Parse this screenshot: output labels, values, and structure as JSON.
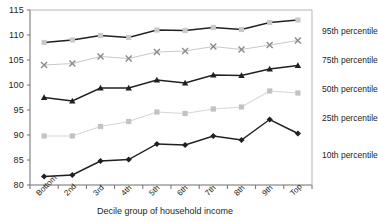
{
  "chart_data": {
    "type": "line",
    "title": "",
    "xlabel": "Decile group of household income",
    "ylabel": "",
    "categories": [
      "Bottom",
      "2nd",
      "3rd",
      "4th",
      "5th",
      "6th",
      "7th",
      "8th",
      "9th",
      "Top"
    ],
    "ylim": [
      80,
      115
    ],
    "yticks": [
      80,
      85,
      90,
      95,
      100,
      105,
      110,
      115
    ],
    "grid": false,
    "legend_position": "right",
    "series": [
      {
        "name": "95th percentile",
        "marker": "square",
        "line_color": "#231f20",
        "marker_color": "#c9c9c9",
        "values": [
          108.5,
          109.0,
          109.9,
          109.5,
          111.0,
          110.9,
          111.5,
          111.1,
          112.5,
          113.0
        ]
      },
      {
        "name": "75th percentile",
        "marker": "x",
        "line_color": "#c9c9c9",
        "marker_color": "#8c8c8c",
        "values": [
          104.0,
          104.3,
          105.7,
          105.3,
          106.6,
          106.8,
          107.7,
          107.1,
          108.0,
          108.9
        ]
      },
      {
        "name": "50th percentile",
        "marker": "triangle",
        "line_color": "#231f20",
        "marker_color": "#231f20",
        "values": [
          97.5,
          96.8,
          99.4,
          99.4,
          101.0,
          100.4,
          102.0,
          101.9,
          103.2,
          103.9
        ]
      },
      {
        "name": "25th percentile",
        "marker": "square",
        "line_color": "#d6d6d6",
        "marker_color": "#c2c2c2",
        "values": [
          89.8,
          89.8,
          91.7,
          92.7,
          94.6,
          94.3,
          95.2,
          95.6,
          98.8,
          98.4
        ]
      },
      {
        "name": "10th percentile",
        "marker": "diamond",
        "line_color": "#231f20",
        "marker_color": "#231f20",
        "values": [
          81.7,
          82.0,
          84.8,
          85.1,
          88.2,
          88.0,
          89.8,
          89.0,
          93.1,
          90.3
        ]
      }
    ],
    "legend_entries": [
      {
        "label": "95th percentile",
        "y": 27
      },
      {
        "label": "75th percentile",
        "y": 56
      },
      {
        "label": "50th percentile",
        "y": 85
      },
      {
        "label": "25th percentile",
        "y": 114
      },
      {
        "label": "10th percentile",
        "y": 151
      }
    ]
  },
  "axis": {
    "ytick_labels": [
      "115",
      "110",
      "105",
      "100",
      "95",
      "90",
      "85",
      "80"
    ],
    "xtick_labels": [
      "Bottom",
      "2nd",
      "3rd",
      "4th",
      "5th",
      "6th",
      "7th",
      "8th",
      "9th",
      "Top"
    ],
    "xaxis_title": "Decile group of household income"
  }
}
